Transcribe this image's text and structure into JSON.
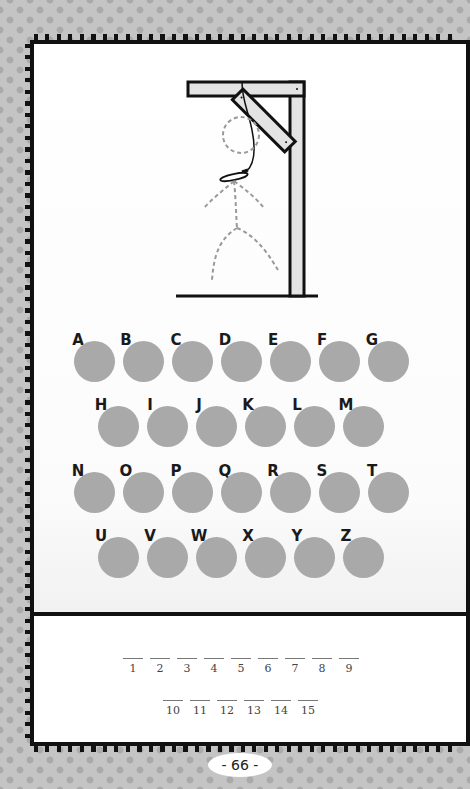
{
  "game": {
    "type": "hangman",
    "drawing": {
      "gallows": "wooden gallows with diagonal brace and noose",
      "figure": "dashed stick figure (outline only)"
    }
  },
  "alphabet": {
    "rows": [
      [
        "A",
        "B",
        "C",
        "D",
        "E",
        "F",
        "G"
      ],
      [
        "H",
        "I",
        "J",
        "K",
        "L",
        "M"
      ],
      [
        "N",
        "O",
        "P",
        "Q",
        "R",
        "S",
        "T"
      ],
      [
        "U",
        "V",
        "W",
        "X",
        "Y",
        "Z"
      ]
    ]
  },
  "answer_blanks": {
    "row1": [
      "1",
      "2",
      "3",
      "4",
      "5",
      "6",
      "7",
      "8",
      "9"
    ],
    "row2": [
      "10",
      "11",
      "12",
      "13",
      "14",
      "15"
    ]
  },
  "page": {
    "number_label": "- 66 -"
  },
  "colors": {
    "circle": "#a9a9a9",
    "border": "#111111",
    "background": "#c4c4c4",
    "dots": "#aaaaaa"
  }
}
